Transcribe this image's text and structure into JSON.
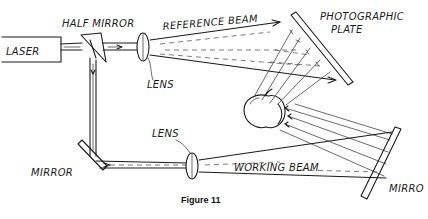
{
  "figure": {
    "caption": "Figure 11",
    "type": "hologram recording setup (hand-drawn)",
    "labels": {
      "laser": "LASER",
      "half_mirror": "HALF MIRROR",
      "reference_beam": "REFERENCE BEAM",
      "photographic_plate_line1": "PHOTOGRAPHIC",
      "photographic_plate_line2": "PLATE",
      "lens_top": "LENS",
      "lens_bottom": "LENS",
      "mirror_left": "MIRROR",
      "working_beam": "WORKING BEAM",
      "mirror_right": "MIRRO"
    },
    "components": [
      "laser",
      "half-mirror",
      "lens (reference path)",
      "photographic plate",
      "object (apple)",
      "mirror (bottom-left)",
      "lens (working path)",
      "mirror (right)"
    ],
    "colors": {
      "ink": "#1a1a1a",
      "background": "#ffffff"
    }
  }
}
